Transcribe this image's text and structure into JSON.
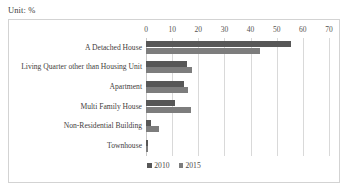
{
  "unit_note": "Unit: %",
  "legend": {
    "position": "bottom-center",
    "entries": [
      {
        "label": "2010",
        "color": "#575757"
      },
      {
        "label": "2015",
        "color": "#7d7d7d"
      }
    ]
  },
  "axis": {
    "ticks": [
      "0",
      "10",
      "20",
      "30",
      "40",
      "50",
      "60",
      "70"
    ]
  },
  "chart_data": {
    "type": "bar",
    "orientation": "horizontal",
    "title": "",
    "subtitle": "",
    "xlabel": "",
    "ylabel": "",
    "unit": "%",
    "xlim": [
      0,
      70
    ],
    "xticks": [
      0,
      10,
      20,
      30,
      40,
      50,
      60,
      70
    ],
    "grid": "vertical",
    "legend_position": "bottom-center",
    "categories": [
      "A Detached House",
      "Living Quarter other than Housing Unit",
      "Apartment",
      "Multi Family House",
      "Non-Residential Building",
      "Townhouse"
    ],
    "series": [
      {
        "name": "2010",
        "color": "#575757",
        "values": [
          55.5,
          15.6,
          14.5,
          11.0,
          1.8,
          0.6
        ]
      },
      {
        "name": "2015",
        "color": "#7d7d7d",
        "values": [
          43.5,
          17.5,
          16.0,
          17.3,
          5.0,
          0.9
        ]
      }
    ]
  }
}
